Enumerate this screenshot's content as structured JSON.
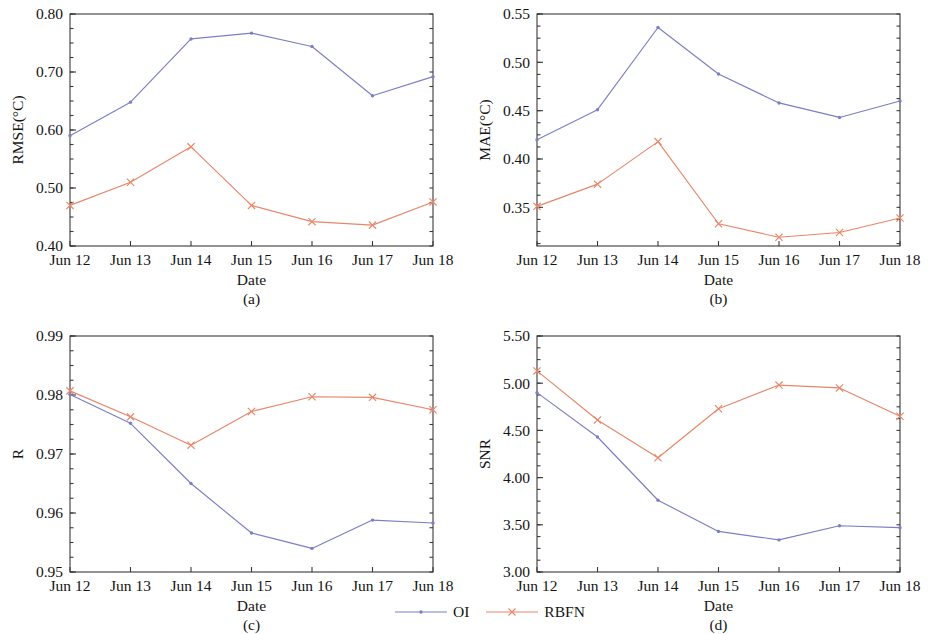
{
  "figure": {
    "series_names": [
      "OI",
      "RBFN"
    ],
    "colors": {
      "oi": "#7b7fc4",
      "rbfn": "#e8866a"
    },
    "legend": {
      "oi_label": "OI",
      "rbfn_label": "RBFN",
      "oi_marker": "dot-marker",
      "rbfn_marker": "x-marker"
    },
    "x_categories": [
      "Jun 12",
      "Jun 13",
      "Jun 14",
      "Jun 15",
      "Jun 16",
      "Jun 17",
      "Jun 18"
    ],
    "xlabel": "Date"
  },
  "chart_data": [
    {
      "id": "a",
      "type": "line",
      "caption": "(a)",
      "title": "",
      "xlabel": "Date",
      "ylabel": "RMSE(°C)",
      "categories": [
        "Jun 12",
        "Jun 13",
        "Jun 14",
        "Jun 15",
        "Jun 16",
        "Jun 17",
        "Jun 18"
      ],
      "ylim": [
        0.4,
        0.8
      ],
      "yticks": [
        "0.40",
        "0.50",
        "0.60",
        "0.70",
        "0.80"
      ],
      "ytick_values": [
        0.4,
        0.5,
        0.6,
        0.7,
        0.8
      ],
      "minor_tick_step": 0.025,
      "grid": false,
      "legend_position": "figure-bottom-center",
      "series": [
        {
          "name": "OI",
          "values": [
            0.59,
            0.648,
            0.757,
            0.767,
            0.744,
            0.659,
            0.692
          ]
        },
        {
          "name": "RBFN",
          "values": [
            0.47,
            0.51,
            0.571,
            0.47,
            0.442,
            0.436,
            0.476
          ]
        }
      ]
    },
    {
      "id": "b",
      "type": "line",
      "caption": "(b)",
      "title": "",
      "xlabel": "Date",
      "ylabel": "MAE(°C)",
      "categories": [
        "Jun 12",
        "Jun 13",
        "Jun 14",
        "Jun 15",
        "Jun 16",
        "Jun 17",
        "Jun 18"
      ],
      "ylim": [
        0.31,
        0.55
      ],
      "yticks": [
        "0.35",
        "0.40",
        "0.45",
        "0.50",
        "0.55"
      ],
      "ytick_values": [
        0.35,
        0.4,
        0.45,
        0.5,
        0.55
      ],
      "minor_tick_step": 0.0125,
      "grid": false,
      "legend_position": "figure-bottom-center",
      "series": [
        {
          "name": "OI",
          "values": [
            0.42,
            0.451,
            0.536,
            0.488,
            0.458,
            0.443,
            0.46
          ]
        },
        {
          "name": "RBFN",
          "values": [
            0.351,
            0.374,
            0.418,
            0.333,
            0.319,
            0.324,
            0.339
          ]
        }
      ]
    },
    {
      "id": "c",
      "type": "line",
      "caption": "(c)",
      "title": "",
      "xlabel": "Date",
      "ylabel": "R",
      "categories": [
        "Jun 12",
        "Jun 13",
        "Jun 14",
        "Jun 15",
        "Jun 16",
        "Jun 17",
        "Jun 18"
      ],
      "ylim": [
        0.95,
        0.99
      ],
      "yticks": [
        "0.95",
        "0.96",
        "0.97",
        "0.98",
        "0.99"
      ],
      "ytick_values": [
        0.95,
        0.96,
        0.97,
        0.98,
        0.99
      ],
      "minor_tick_step": 0.0025,
      "grid": false,
      "legend_position": "figure-bottom-center",
      "series": [
        {
          "name": "OI",
          "values": [
            0.9801,
            0.9752,
            0.965,
            0.9566,
            0.954,
            0.9588,
            0.9583
          ]
        },
        {
          "name": "RBFN",
          "values": [
            0.9807,
            0.9763,
            0.9715,
            0.9772,
            0.9797,
            0.9796,
            0.9775
          ]
        }
      ]
    },
    {
      "id": "d",
      "type": "line",
      "caption": "(d)",
      "title": "",
      "xlabel": "Date",
      "ylabel": "SNR",
      "categories": [
        "Jun 12",
        "Jun 13",
        "Jun 14",
        "Jun 15",
        "Jun 16",
        "Jun 17",
        "Jun 18"
      ],
      "ylim": [
        3.0,
        5.5
      ],
      "yticks": [
        "3.00",
        "3.50",
        "4.00",
        "4.50",
        "5.00",
        "5.50"
      ],
      "ytick_values": [
        3.0,
        3.5,
        4.0,
        4.5,
        5.0,
        5.5
      ],
      "minor_tick_step": 0.125,
      "grid": false,
      "legend_position": "figure-bottom-center",
      "series": [
        {
          "name": "OI",
          "values": [
            4.9,
            4.43,
            3.76,
            3.43,
            3.34,
            3.49,
            3.47
          ]
        },
        {
          "name": "RBFN",
          "values": [
            5.13,
            4.61,
            4.21,
            4.73,
            4.98,
            4.95,
            4.65
          ]
        }
      ]
    }
  ]
}
